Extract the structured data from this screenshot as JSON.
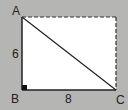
{
  "diagram": {
    "type": "right-triangle-in-rectangle",
    "vertices": {
      "A": {
        "label": "A",
        "x": 22,
        "y": 17
      },
      "B": {
        "label": "B",
        "x": 22,
        "y": 90
      },
      "C": {
        "label": "C",
        "x": 116,
        "y": 90
      },
      "D": {
        "x": 116,
        "y": 17
      }
    },
    "sides": {
      "AB": {
        "label": "6"
      },
      "BC": {
        "label": "8"
      }
    },
    "right_angle_at": "B",
    "dashed_edges": [
      "top",
      "right"
    ],
    "colors": {
      "background": "#b5b5b3",
      "fill": "#ffffff",
      "stroke": "#222222"
    }
  }
}
